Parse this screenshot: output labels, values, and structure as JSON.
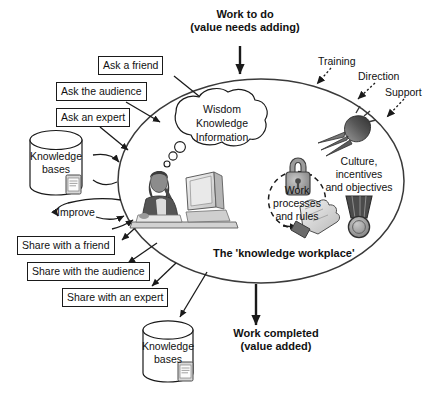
{
  "diagram": {
    "title": "The 'knowledge workplace'",
    "central_label": "The 'knowledge workplace'",
    "colors": {
      "stroke": "#1a1a1a",
      "ellipse": "#3a3a3a",
      "background": "#ffffff",
      "icon_gray": "#8a8a8a",
      "icon_dark": "#4a4a4a"
    }
  },
  "top": {
    "input_line1": "Work to do",
    "input_line2": "(value needs adding)"
  },
  "bottom": {
    "output_line1": "Work completed",
    "output_line2": "(value added)"
  },
  "inputs_left": [
    {
      "label": "Ask a friend"
    },
    {
      "label": "Ask the audience"
    },
    {
      "label": "Ask an expert"
    }
  ],
  "outputs_left": [
    {
      "label": "Share with a friend"
    },
    {
      "label": "Share with the audience"
    },
    {
      "label": "Share with an expert"
    }
  ],
  "improve": {
    "label": "Improve"
  },
  "knowledge_base_top": {
    "line1": "Knowledge",
    "line2": "bases"
  },
  "knowledge_base_bottom": {
    "line1": "Knowledge",
    "line2": "bases"
  },
  "thought_bubble": {
    "line1": "Wisdom",
    "line2": "Knowledge",
    "line3": "Information"
  },
  "work_processes": {
    "line1": "Work",
    "line2": "processes",
    "line3": "and rules"
  },
  "culture": {
    "line1": "Culture,",
    "line2": "incentives",
    "line3": "and objectives"
  },
  "enablers": [
    {
      "label": "Training"
    },
    {
      "label": "Direction"
    },
    {
      "label": "Support"
    }
  ],
  "icons": {
    "lock": "lock-icon",
    "carrot": "carrot-icon",
    "glove": "glove-icon",
    "medal": "medal-icon",
    "worker": "worker-at-desk-image",
    "tablet_top": "tablet-document-icon",
    "tablet_bottom": "tablet-document-icon"
  }
}
